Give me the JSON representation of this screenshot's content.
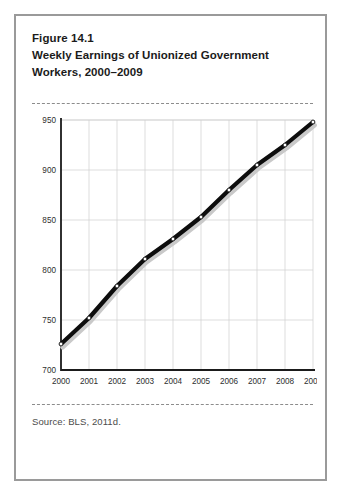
{
  "figure": {
    "number": "Figure 14.1",
    "title_line1": "Weekly Earnings of Unionized Government",
    "title_line2": "Workers, 2000–2009",
    "source": "Source: BLS, 2011d."
  },
  "colors": {
    "border": "#9a9a9a",
    "line": "#0d0d0d",
    "shadow": "#c9c9c9",
    "grid": "#cfcfcf",
    "axis": "#1b1b1b",
    "marker_fill": "#ffffff",
    "text": "#1b1b1b"
  },
  "chart_data": {
    "type": "line",
    "title": "Weekly Earnings of Unionized Government Workers, 2000–2009",
    "xlabel": "",
    "ylabel": "",
    "categories": [
      "2000",
      "2001",
      "2002",
      "2003",
      "2004",
      "2005",
      "2006",
      "2007",
      "2008",
      "2009"
    ],
    "x": [
      2000,
      2001,
      2002,
      2003,
      2004,
      2005,
      2006,
      2007,
      2008,
      2009
    ],
    "values": [
      726,
      752,
      784,
      811,
      831,
      853,
      880,
      905,
      925,
      948
    ],
    "series": [
      {
        "name": "Weekly earnings",
        "values": [
          726,
          752,
          784,
          811,
          831,
          853,
          880,
          905,
          925,
          948
        ]
      }
    ],
    "ylim": [
      700,
      950
    ],
    "yticks": [
      700,
      750,
      800,
      850,
      900,
      950
    ],
    "ytick_labels": [
      "700",
      "750",
      "800",
      "850",
      "900",
      "950"
    ],
    "xtick_labels": [
      "2000",
      "2001",
      "2002",
      "2003",
      "2004",
      "2005",
      "2006",
      "2007",
      "2008",
      "2009"
    ],
    "grid": true,
    "legend": false,
    "markers": "white-circle",
    "line_shadow": true
  }
}
